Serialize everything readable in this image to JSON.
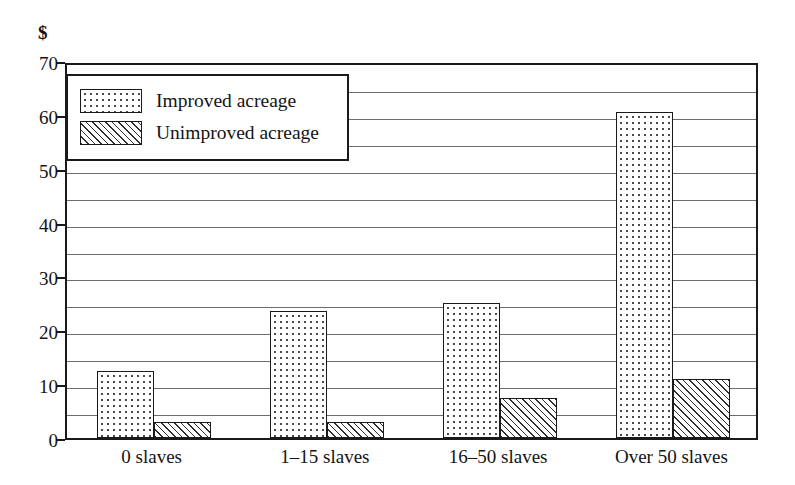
{
  "chart_data": {
    "type": "bar",
    "title": "",
    "subtitle": "",
    "xlabel": "",
    "ylabel": "$",
    "ylim": [
      0,
      70
    ],
    "ytick_step": 10,
    "gridline_step": 5,
    "grid": true,
    "legend_position": "top-left",
    "categories": [
      "0 slaves",
      "1–15 slaves",
      "16–50 slaves",
      "Over 50 slaves"
    ],
    "yticks": [
      "0",
      "10",
      "20",
      "30",
      "40",
      "50",
      "60",
      "70"
    ],
    "series": [
      {
        "name": "Improved acreage",
        "pattern": "dotted",
        "values": [
          12.5,
          23.5,
          25,
          60.5
        ]
      },
      {
        "name": "Unimproved acreage",
        "pattern": "diagonal-hatch",
        "values": [
          3,
          3,
          7.5,
          11
        ]
      }
    ],
    "colors": {
      "frame": "#1a1a1a",
      "gridline": "#6d6d6d",
      "bar_outline": "#1a1a1a",
      "background": "#ffffff",
      "text": "#141414"
    }
  },
  "legend": {
    "entries": [
      {
        "label": "Improved acreage",
        "pattern": "dotted"
      },
      {
        "label": "Unimproved acreage",
        "pattern": "diagonal-hatch"
      }
    ]
  }
}
